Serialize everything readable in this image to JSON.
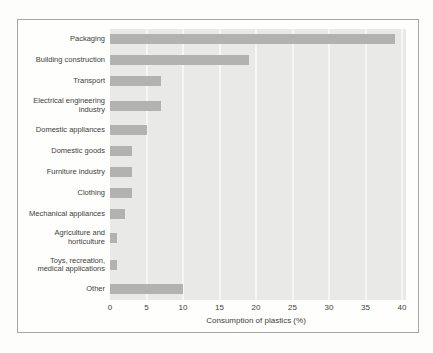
{
  "chart_data": {
    "type": "bar",
    "orientation": "horizontal",
    "title": "",
    "xlabel": "Consumption of plastics (%)",
    "ylabel": "",
    "categories": [
      "Packaging",
      "Building construction",
      "Transport",
      "Electrical engineering industry",
      "Domestic appliances",
      "Domestic goods",
      "Furniture industry",
      "Clothing",
      "Mechanical appliances",
      "Agriculture and horticulture",
      "Toys, recreation, medical applications",
      "Other"
    ],
    "category_lines": [
      [
        "Packaging"
      ],
      [
        "Building construction"
      ],
      [
        "Transport"
      ],
      [
        "Electrical engineering",
        "industry"
      ],
      [
        "Domestic appliances"
      ],
      [
        "Domestic goods"
      ],
      [
        "Furniture industry"
      ],
      [
        "Clothing"
      ],
      [
        "Mechanical appliances"
      ],
      [
        "Agriculture and",
        "horticulture"
      ],
      [
        "Toys, recreation,",
        "medical applications"
      ],
      [
        "Other"
      ]
    ],
    "values": [
      39,
      19,
      7,
      7,
      5,
      3,
      3,
      3,
      2,
      1,
      1,
      10
    ],
    "xlim": [
      0,
      40
    ],
    "xticks": [
      0,
      5,
      10,
      15,
      20,
      25,
      30,
      35,
      40
    ],
    "grid": "vertical gridlines at each x tick",
    "legend": "none"
  },
  "colors": {
    "bar": "#b2b3b0",
    "plot_bg": "#e9e9e7",
    "grid": "#f6f6f4",
    "border": "#a6a6a4",
    "text": "#403f3c"
  },
  "layout_hints": {
    "px_per_unit": 7.3,
    "row_height_single_line": 21,
    "row_height_double_line": 27.4
  }
}
